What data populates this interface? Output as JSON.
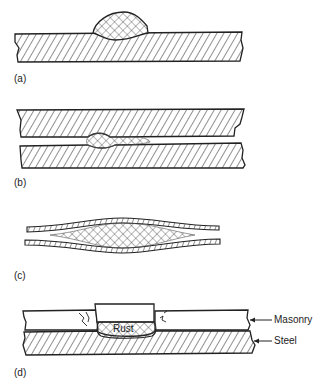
{
  "panels": [
    {
      "id": "a",
      "label": "(a)"
    },
    {
      "id": "b",
      "label": "(b)"
    },
    {
      "id": "c",
      "label": "(c)"
    },
    {
      "id": "d",
      "label": "(d)"
    }
  ],
  "annotations": {
    "rust": "Rust",
    "masonry": "Masonry",
    "steel": "Steel"
  },
  "colors": {
    "ink": "#222222",
    "background": "#ffffff"
  }
}
